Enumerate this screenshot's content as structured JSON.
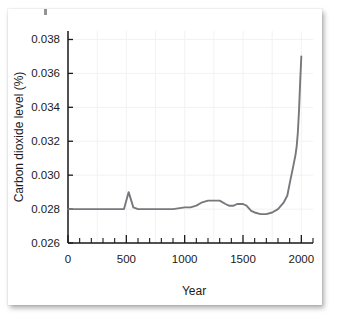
{
  "chart_data": {
    "type": "line",
    "title": "",
    "xlabel": "Year",
    "ylabel": "Carbon dioxide level (%)",
    "xlim": [
      0,
      2100
    ],
    "ylim": [
      0.026,
      0.0385
    ],
    "grid": true,
    "legend": "none",
    "x_ticks": [
      0,
      500,
      1000,
      1500,
      2000
    ],
    "x_ticklabels": [
      "0",
      "500",
      "1000",
      "1500",
      "2000"
    ],
    "x_minor_tick_step": 100,
    "y_ticks": [
      0.026,
      0.028,
      0.03,
      0.032,
      0.034,
      0.036,
      0.038
    ],
    "y_ticklabels": [
      "0.026",
      "0.028",
      "0.030",
      "0.032",
      "0.034",
      "0.036",
      "0.038"
    ],
    "series": [
      {
        "name": "Atmospheric carbon dioxide",
        "color": "#77787c",
        "x": [
          0,
          100,
          200,
          300,
          400,
          480,
          520,
          560,
          600,
          650,
          700,
          800,
          900,
          1000,
          1050,
          1100,
          1150,
          1200,
          1250,
          1300,
          1350,
          1380,
          1420,
          1450,
          1500,
          1530,
          1570,
          1600,
          1650,
          1700,
          1750,
          1800,
          1850,
          1880,
          1900,
          1930,
          1950,
          1960,
          1970,
          1980,
          1990,
          2000
        ],
        "y": [
          0.028,
          0.028,
          0.028,
          0.028,
          0.028,
          0.028,
          0.029,
          0.0281,
          0.028,
          0.028,
          0.028,
          0.028,
          0.028,
          0.0281,
          0.0281,
          0.0282,
          0.0284,
          0.0285,
          0.0285,
          0.0285,
          0.0283,
          0.0282,
          0.0282,
          0.0283,
          0.0283,
          0.0282,
          0.0279,
          0.0278,
          0.0277,
          0.0277,
          0.0278,
          0.028,
          0.0284,
          0.0288,
          0.0295,
          0.0305,
          0.0312,
          0.0317,
          0.0325,
          0.0338,
          0.0355,
          0.037
        ]
      }
    ]
  },
  "figure": {
    "y_axis_title": "Carbon dioxide level (%)",
    "x_axis_title": "Year"
  }
}
